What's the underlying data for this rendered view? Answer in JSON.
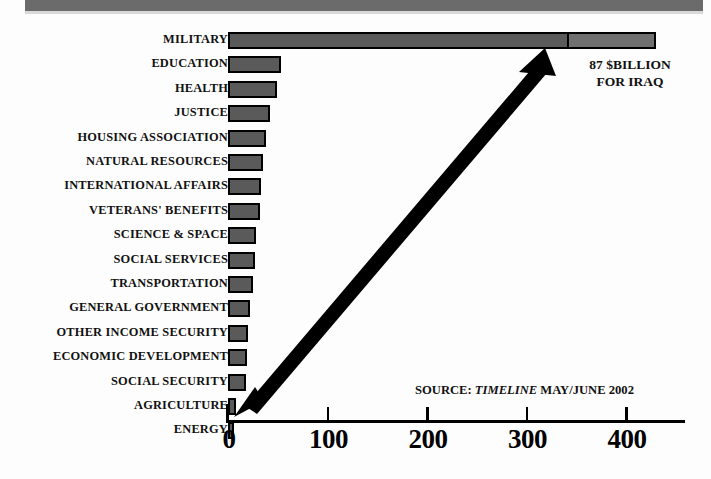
{
  "header": {
    "band_color": "#6b6b6b"
  },
  "annotations": {
    "iraq_line1": "87 $BILLION",
    "iraq_line2": "FOR IRAQ",
    "source_prefix": "SOURCE:",
    "source_publication": "TIMELINE",
    "source_date": "MAY/JUNE 2002",
    "arrow_name": "double-headed-comparison-arrow"
  },
  "chart_data": {
    "type": "bar",
    "orientation": "horizontal",
    "title": "",
    "subtitle": "",
    "xlabel": "",
    "ylabel": "",
    "xlim": [
      0,
      460
    ],
    "xticks": [
      0,
      100,
      200,
      300,
      400
    ],
    "xtick_labels": [
      "0",
      "100",
      "200",
      "300",
      "400"
    ],
    "grid": false,
    "legend": false,
    "units": "$ billions",
    "bar_color": "#5a5a5a",
    "bar_edge_color": "#000000",
    "supplement_color": "#707070",
    "categories": [
      "MILITARY",
      "EDUCATION",
      "HEALTH",
      "JUSTICE",
      "HOUSING ASSOCIATION",
      "NATURAL RESOURCES",
      "INTERNATIONAL AFFAIRS",
      "VETERANS' BENEFITS",
      "SCIENCE & SPACE",
      "SOCIAL SERVICES",
      "TRANSPORTATION",
      "GENERAL GOVERNMENT",
      "OTHER INCOME SECURITY",
      "ECONOMIC DEVELOPMENT",
      "SOCIAL SECURITY",
      "AGRICULTURE",
      "ENERGY"
    ],
    "values": [
      343,
      53,
      49,
      42,
      38,
      35,
      33,
      32,
      28,
      27,
      25,
      22,
      20,
      19,
      18,
      8,
      4
    ],
    "extra_segment": {
      "category": "MILITARY",
      "label": "87 $BILLION FOR IRAQ",
      "value": 87,
      "start": 343,
      "end": 430
    }
  }
}
